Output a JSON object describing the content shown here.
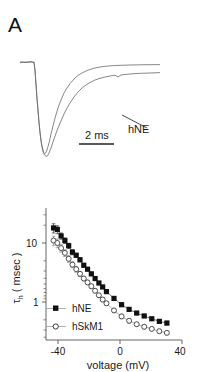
{
  "figure": {
    "background_color": "#ffffff",
    "line_color": "#4a4a4a",
    "marker_fill_color": "#111111",
    "marker_open_color": "#ffffff",
    "axis_color": "#555555"
  },
  "panel_a": {
    "letter": "A",
    "scalebar_label": "2 ms",
    "trace_label": "hNE",
    "description": "Overlaid normalized sodium current traces showing inward peak and decay"
  },
  "panel_b": {
    "letter": "B",
    "chart_data": {
      "type": "line",
      "title": "",
      "xlabel": "voltage (mV)",
      "ylabel": "τ h ( msec )",
      "ylabel_symbol": "τ",
      "ylabel_subscript": "h",
      "ylabel_units": "( msec )",
      "yscale": "log",
      "xlim": [
        -50,
        40
      ],
      "ylim": [
        0.22,
        26
      ],
      "xticks": [
        -40,
        0,
        40
      ],
      "xticklabels": [
        "-40",
        "0",
        "40"
      ],
      "yticks": [
        1,
        10
      ],
      "yticklabels": [
        "1",
        "10"
      ],
      "grid": false,
      "legend_position": "lower-left",
      "series": [
        {
          "name": "hNE",
          "marker": "filled-square",
          "x": [
            -45,
            -42.5,
            -40,
            -37.5,
            -35,
            -32.5,
            -30,
            -27.5,
            -25,
            -22.5,
            -20,
            -17.5,
            -15,
            -12.5,
            -10,
            -5,
            0,
            5,
            10,
            15,
            20,
            25,
            30
          ],
          "values": [
            18.0,
            17.0,
            13.2,
            11.0,
            9.0,
            7.0,
            6.2,
            5.2,
            4.2,
            3.6,
            3.0,
            2.5,
            2.1,
            1.8,
            1.5,
            1.15,
            0.9,
            0.75,
            0.65,
            0.58,
            0.52,
            0.47,
            0.44
          ],
          "yerr": [
            3.2,
            2.6,
            1.6,
            1.2,
            0.9,
            0.7,
            0.5,
            0.4,
            0.3,
            0.25,
            0.2,
            0.16,
            0.13,
            0.11,
            0.09,
            0.07,
            0.06,
            0.05,
            0.04,
            0.035,
            0.03,
            0.03,
            0.03
          ]
        },
        {
          "name": "hSkM1",
          "marker": "open-circle",
          "x": [
            -45,
            -42.5,
            -40,
            -37.5,
            -35,
            -32.5,
            -30,
            -27.5,
            -25,
            -22.5,
            -20,
            -17.5,
            -15,
            -12.5,
            -10,
            -5,
            0,
            5,
            10,
            15,
            20,
            25,
            30
          ],
          "values": [
            11.0,
            10.0,
            8.2,
            6.8,
            5.4,
            4.3,
            3.6,
            3.0,
            2.5,
            2.15,
            1.85,
            1.55,
            1.3,
            1.1,
            0.95,
            0.72,
            0.57,
            0.48,
            0.42,
            0.38,
            0.35,
            0.32,
            0.3
          ],
          "yerr": [
            2.0,
            1.7,
            1.2,
            0.9,
            0.7,
            0.5,
            0.4,
            0.3,
            0.22,
            0.18,
            0.15,
            0.12,
            0.1,
            0.09,
            0.07,
            0.06,
            0.05,
            0.04,
            0.03,
            0.03,
            0.025,
            0.025,
            0.02
          ]
        }
      ],
      "legend": [
        {
          "label": "hNE",
          "marker": "filled-square"
        },
        {
          "label": "hSkM1",
          "marker": "open-circle"
        }
      ]
    }
  }
}
